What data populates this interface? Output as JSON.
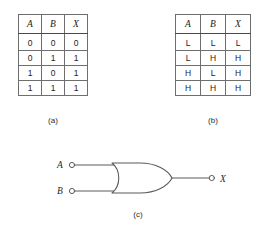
{
  "figure": {
    "line_color": "#6e6e6e",
    "text_color": "#222222"
  },
  "table_a": {
    "caption": "(a)",
    "headers": [
      "A",
      "B",
      "X"
    ],
    "rows": [
      [
        "0",
        "0",
        "0"
      ],
      [
        "0",
        "1",
        "1"
      ],
      [
        "1",
        "0",
        "1"
      ],
      [
        "1",
        "1",
        "1"
      ]
    ]
  },
  "table_b": {
    "caption": "(b)",
    "headers": [
      "A",
      "B",
      "X"
    ],
    "rows": [
      [
        "L",
        "L",
        "L"
      ],
      [
        "L",
        "H",
        "H"
      ],
      [
        "H",
        "L",
        "H"
      ],
      [
        "H",
        "H",
        "H"
      ]
    ]
  },
  "gate": {
    "caption": "(c)",
    "type": "OR",
    "inputs": [
      "A",
      "B"
    ],
    "output": "X"
  }
}
